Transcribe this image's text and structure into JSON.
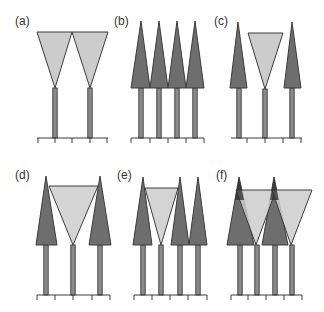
{
  "figure": {
    "colors": {
      "dark_fill": "#6e6e6e",
      "light_fill": "#cccccc",
      "outline": "#3c3c3c",
      "stem_fill": "#8a8a8a",
      "axis": "#3c3c3c"
    },
    "panels": [
      {
        "id": "a",
        "label": "(a)",
        "label_pos": [
          15,
          25
        ],
        "baseline": {
          "y": 138,
          "x1": 37,
          "x2": 108,
          "ticks": [
            38,
            55,
            72,
            90,
            107
          ]
        },
        "stems": [
          {
            "x": 55,
            "top": 88
          },
          {
            "x": 90,
            "top": 88
          }
        ],
        "dark_crowns": [],
        "light_crowns": [
          {
            "points": "37,32 72,32 55,88"
          },
          {
            "points": "72,32 108,32 90,88"
          }
        ]
      },
      {
        "id": "b",
        "label": "(b)",
        "label_pos": [
          114,
          25
        ],
        "baseline": {
          "y": 138,
          "x1": 131,
          "x2": 204,
          "ticks": [
            131,
            150,
            168,
            186,
            204
          ]
        },
        "stems": [
          {
            "x": 141,
            "top": 88
          },
          {
            "x": 159,
            "top": 88
          },
          {
            "x": 177,
            "top": 88
          },
          {
            "x": 195,
            "top": 88
          }
        ],
        "dark_crowns": [
          {
            "points": "141,21 131,88 150,88"
          },
          {
            "points": "159,21 150,88 168,88"
          },
          {
            "points": "177,21 168,88 186,88"
          },
          {
            "points": "195,21 186,88 204,88"
          }
        ],
        "light_crowns": []
      },
      {
        "id": "c",
        "label": "(c)",
        "label_pos": [
          214,
          25
        ],
        "baseline": {
          "y": 138,
          "x1": 231,
          "x2": 302,
          "ticks": [
            247,
            265,
            283,
            301
          ]
        },
        "stems": [
          {
            "x": 239,
            "top": 88
          },
          {
            "x": 265,
            "top": 89
          },
          {
            "x": 292,
            "top": 88
          }
        ],
        "dark_crowns": [
          {
            "points": "238,22 230,88 247,88"
          },
          {
            "points": "292,22 284,88 301,88"
          }
        ],
        "light_crowns": [
          {
            "points": "248,33 283,33 265,89"
          }
        ]
      },
      {
        "id": "d",
        "label": "(d)",
        "label_pos": [
          15,
          179
        ],
        "baseline": {
          "y": 295,
          "x1": 37,
          "x2": 110,
          "ticks": [
            37,
            55,
            73,
            92,
            110
          ]
        },
        "stems": [
          {
            "x": 46,
            "top": 245
          },
          {
            "x": 73,
            "top": 245
          },
          {
            "x": 100,
            "top": 245
          }
        ],
        "dark_crowns": [
          {
            "points": "46,176 36,245 57,245"
          },
          {
            "points": "100,176 89,245 111,245"
          }
        ],
        "light_crowns": [
          {
            "points": "49,186 98,186 73,245"
          }
        ]
      },
      {
        "id": "e",
        "label": "(e)",
        "label_pos": [
          117,
          179
        ],
        "baseline": {
          "y": 295,
          "x1": 134,
          "x2": 207,
          "ticks": [
            134,
            152,
            170,
            188,
            207
          ]
        },
        "stems": [
          {
            "x": 143,
            "top": 245
          },
          {
            "x": 161,
            "top": 245
          },
          {
            "x": 180,
            "top": 245
          },
          {
            "x": 198,
            "top": 245
          }
        ],
        "dark_crowns": [
          {
            "points": "143,177 133,245 152,245"
          },
          {
            "points": "180,177 171,245 189,245"
          },
          {
            "points": "198,177 189,245 207,245"
          }
        ],
        "light_crowns": [
          {
            "points": "145,188 178,188 161,245"
          }
        ]
      },
      {
        "id": "f",
        "label": "(f)",
        "label_pos": [
          216,
          179
        ],
        "baseline": {
          "y": 295,
          "x1": 231,
          "x2": 302,
          "ticks": [
            231,
            248,
            266,
            284,
            302
          ]
        },
        "stems": [
          {
            "x": 240,
            "top": 245
          },
          {
            "x": 257,
            "top": 245
          },
          {
            "x": 275,
            "top": 245
          },
          {
            "x": 292,
            "top": 245
          }
        ],
        "dark_crowns": [
          {
            "points": "239,177 227,245 254,245"
          },
          {
            "points": "274,177 262,245 288,245"
          }
        ],
        "light_crowns": [
          {
            "points": "236,190 276,190 256,245"
          },
          {
            "points": "272,190 312,190 291,245"
          }
        ]
      }
    ]
  }
}
